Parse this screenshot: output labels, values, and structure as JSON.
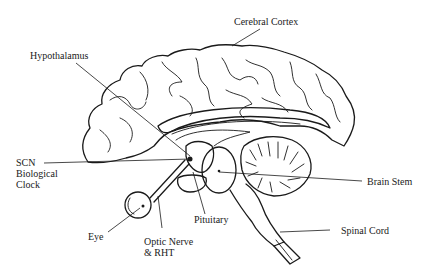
{
  "diagram": {
    "labels": {
      "cerebral_cortex": "Cerebral Cortex",
      "hypothalamus": "Hypothalamus",
      "scn_line1": "SCN",
      "scn_line2": "Biological",
      "scn_line3": "Clock",
      "brain_stem": "Brain Stem",
      "pituitary": "Pituitary",
      "eye": "Eye",
      "optic_nerve_line1": "Optic Nerve",
      "optic_nerve_line2": "& RHT",
      "spinal_cord": "Spinal Cord"
    },
    "colors": {
      "ink": "#1a1a1a",
      "background": "#ffffff"
    }
  }
}
